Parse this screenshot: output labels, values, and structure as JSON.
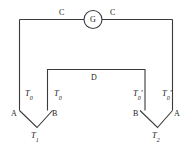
{
  "diagram": {
    "meter": {
      "symbol": "G",
      "name": "galvanometer"
    },
    "wires": {
      "lead_left_label": "C",
      "lead_right_label": "C",
      "bridge_label": "D"
    },
    "junction_left": {
      "conductor_left_label": "A",
      "conductor_right_label": "B",
      "temp_left_label": "T",
      "temp_left_sub": "0",
      "temp_right_label": "T",
      "temp_right_sub": "0",
      "vertex_temp_label": "T",
      "vertex_temp_sub": "1"
    },
    "junction_right": {
      "conductor_left_label": "B",
      "conductor_right_label": "A",
      "temp_left_label": "T",
      "temp_left_sub": "0",
      "temp_left_prime": "′",
      "temp_right_label": "T",
      "temp_right_sub": "0",
      "temp_right_prime": "′",
      "vertex_temp_label": "T",
      "vertex_temp_sub": "2"
    },
    "colors": {
      "wire": "#3a3a3a",
      "text": "#222222",
      "background": "#ffffff"
    }
  }
}
